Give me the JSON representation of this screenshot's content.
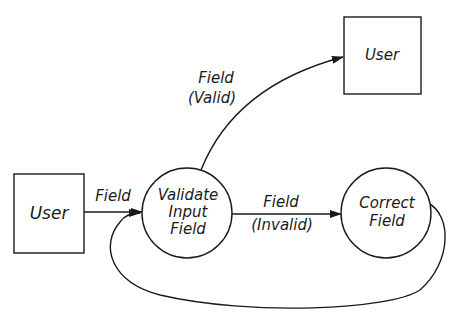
{
  "diagram": {
    "type": "data-flow",
    "nodes": [
      {
        "id": "user_source",
        "shape": "rectangle",
        "label": "User"
      },
      {
        "id": "validate",
        "shape": "circle",
        "label_lines": [
          "Validate",
          "Input",
          "Field"
        ]
      },
      {
        "id": "correct",
        "shape": "circle",
        "label_lines": [
          "Correct",
          "Field"
        ]
      },
      {
        "id": "user_sink",
        "shape": "rectangle",
        "label": "User"
      }
    ],
    "edges": [
      {
        "from": "user_source",
        "to": "validate",
        "label_lines": [
          "Field"
        ]
      },
      {
        "from": "validate",
        "to": "correct",
        "label_lines": [
          "Field",
          "(Invalid)"
        ]
      },
      {
        "from": "validate",
        "to": "user_sink",
        "label_lines": [
          "Field",
          "(Valid)"
        ]
      },
      {
        "from": "correct",
        "to": "validate",
        "label_lines": []
      }
    ]
  }
}
